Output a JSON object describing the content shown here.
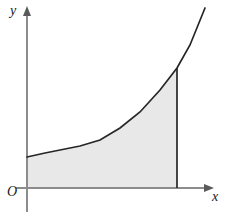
{
  "figure": {
    "background_color": "#ffffff",
    "labels": {
      "y_axis": "y",
      "x_axis": "x",
      "origin": "O"
    },
    "colors": {
      "axis": "#8c8c8c",
      "curve": "#262626",
      "boundary_line": "#262626",
      "shading": "#e8e8e8",
      "label_text": "#1a1a1a"
    }
  },
  "chart_data": {
    "type": "area",
    "xlabel": "x",
    "ylabel": "y",
    "legend": [],
    "grid": false,
    "axes": {
      "x_axis_y_pixel": 188,
      "y_axis_x_pixel": 27,
      "x_arrow_tip_pixel": 213,
      "y_arrow_tip_pixel": 8,
      "arrowheads": [
        "x-axis-right",
        "y-axis-top"
      ],
      "tick_labels_x": [],
      "tick_labels_y": []
    },
    "series": [
      {
        "name": "curve",
        "description": "increasing convex exponential-like curve",
        "points_pixel": [
          [
            27,
            157
          ],
          [
            45,
            153
          ],
          [
            60,
            150
          ],
          [
            80,
            146
          ],
          [
            100,
            140
          ],
          [
            120,
            128
          ],
          [
            140,
            112
          ],
          [
            160,
            90
          ],
          [
            177,
            68
          ],
          [
            190,
            45
          ],
          [
            205,
            8
          ]
        ]
      }
    ],
    "shaded_region": {
      "fill": "#e8e8e8",
      "bounded_by": [
        "y-axis",
        "x-axis",
        "curve",
        "vertical line at x = b"
      ],
      "right_boundary_x_pixel": 177,
      "right_boundary_top_pixel": 68,
      "right_boundary_bottom_pixel": 188
    }
  }
}
